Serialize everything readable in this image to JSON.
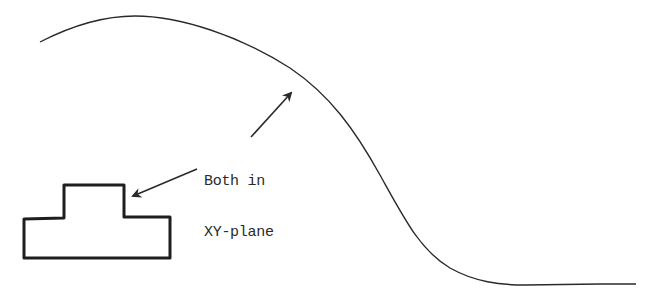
{
  "diagram": {
    "annotation": {
      "line1": "Both in",
      "line2": "XY-plane"
    },
    "elements": [
      {
        "id": "sweep-path-curve",
        "description": "S-shaped spline curve (path) in XY-plane"
      },
      {
        "id": "profile-shape",
        "description": "Closed stepped T-shaped profile in XY-plane"
      },
      {
        "id": "arrow-to-curve",
        "description": "Arrow pointing from label to curve"
      },
      {
        "id": "arrow-to-profile",
        "description": "Arrow pointing from label to profile"
      }
    ],
    "colors": {
      "background": "#ffffff",
      "stroke": "#2a2a2a",
      "text": "#2a2a2a"
    }
  }
}
